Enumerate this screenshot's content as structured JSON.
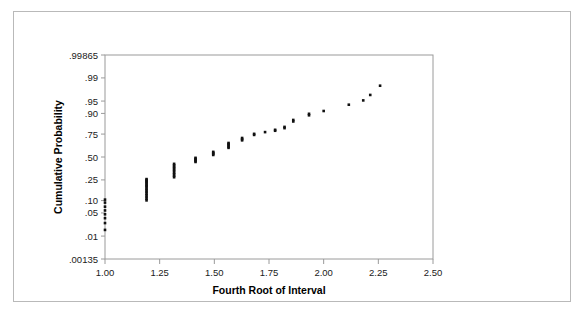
{
  "figure": {
    "background_color": "#ffffff",
    "border_color": "#b9b9b9",
    "point_color": "#111111",
    "axis_color": "#9a9a9a"
  },
  "chart_data": {
    "type": "scatter",
    "title": "",
    "subtitle": "",
    "xlabel": "Fourth Root of Interval",
    "ylabel": "Cumulative Probability",
    "yscale": "normal-probability (probit)",
    "xlim": [
      1.0,
      2.5
    ],
    "ylim": [
      0.00135,
      0.99865
    ],
    "grid": false,
    "legend": null,
    "xticks": [
      "1.00",
      "1.25",
      "1.50",
      "1.75",
      "2.00",
      "2.25",
      "2.50"
    ],
    "xtick_values": [
      1.0,
      1.25,
      1.5,
      1.75,
      2.0,
      2.25,
      2.5
    ],
    "yticks": [
      ".99865",
      ".99",
      ".95",
      ".90",
      ".75",
      ".50",
      ".25",
      ".10",
      ".05",
      ".01",
      ".00135"
    ],
    "ytick_values": [
      0.99865,
      0.99,
      0.95,
      0.9,
      0.75,
      0.5,
      0.25,
      0.1,
      0.05,
      0.01,
      0.00135
    ],
    "ytick_z": [
      3.0,
      2.326,
      1.645,
      1.282,
      0.674,
      0.0,
      -0.674,
      -1.282,
      -1.645,
      -2.326,
      -3.0
    ],
    "points": [
      {
        "x": 1.0,
        "y": 0.105
      },
      {
        "x": 1.0,
        "y": 0.09
      },
      {
        "x": 1.0,
        "y": 0.072
      },
      {
        "x": 1.0,
        "y": 0.058
      },
      {
        "x": 1.0,
        "y": 0.046
      },
      {
        "x": 1.0,
        "y": 0.036
      },
      {
        "x": 1.0,
        "y": 0.026
      },
      {
        "x": 1.0,
        "y": 0.016
      },
      {
        "x": 1.19,
        "y": 0.258
      },
      {
        "x": 1.19,
        "y": 0.248
      },
      {
        "x": 1.19,
        "y": 0.238
      },
      {
        "x": 1.19,
        "y": 0.228
      },
      {
        "x": 1.19,
        "y": 0.218
      },
      {
        "x": 1.19,
        "y": 0.206
      },
      {
        "x": 1.19,
        "y": 0.196
      },
      {
        "x": 1.19,
        "y": 0.186
      },
      {
        "x": 1.19,
        "y": 0.174
      },
      {
        "x": 1.19,
        "y": 0.163
      },
      {
        "x": 1.19,
        "y": 0.152
      },
      {
        "x": 1.19,
        "y": 0.141
      },
      {
        "x": 1.19,
        "y": 0.13
      },
      {
        "x": 1.19,
        "y": 0.12
      },
      {
        "x": 1.19,
        "y": 0.11
      },
      {
        "x": 1.19,
        "y": 0.101
      },
      {
        "x": 1.316,
        "y": 0.42
      },
      {
        "x": 1.316,
        "y": 0.404
      },
      {
        "x": 1.316,
        "y": 0.388
      },
      {
        "x": 1.316,
        "y": 0.372
      },
      {
        "x": 1.316,
        "y": 0.356
      },
      {
        "x": 1.316,
        "y": 0.34
      },
      {
        "x": 1.316,
        "y": 0.322
      },
      {
        "x": 1.316,
        "y": 0.306
      },
      {
        "x": 1.316,
        "y": 0.29
      },
      {
        "x": 1.316,
        "y": 0.276
      },
      {
        "x": 1.414,
        "y": 0.49
      },
      {
        "x": 1.414,
        "y": 0.478
      },
      {
        "x": 1.414,
        "y": 0.466
      },
      {
        "x": 1.414,
        "y": 0.454
      },
      {
        "x": 1.414,
        "y": 0.442
      },
      {
        "x": 1.495,
        "y": 0.56
      },
      {
        "x": 1.495,
        "y": 0.548
      },
      {
        "x": 1.495,
        "y": 0.536
      },
      {
        "x": 1.495,
        "y": 0.524
      },
      {
        "x": 1.565,
        "y": 0.66
      },
      {
        "x": 1.565,
        "y": 0.648
      },
      {
        "x": 1.565,
        "y": 0.634
      },
      {
        "x": 1.565,
        "y": 0.62
      },
      {
        "x": 1.565,
        "y": 0.606
      },
      {
        "x": 1.627,
        "y": 0.712
      },
      {
        "x": 1.627,
        "y": 0.7
      },
      {
        "x": 1.627,
        "y": 0.688
      },
      {
        "x": 1.682,
        "y": 0.752
      },
      {
        "x": 1.682,
        "y": 0.742
      },
      {
        "x": 1.732,
        "y": 0.768
      },
      {
        "x": 1.778,
        "y": 0.788
      },
      {
        "x": 1.778,
        "y": 0.78
      },
      {
        "x": 1.821,
        "y": 0.812
      },
      {
        "x": 1.821,
        "y": 0.802
      },
      {
        "x": 1.861,
        "y": 0.862
      },
      {
        "x": 1.861,
        "y": 0.852
      },
      {
        "x": 1.933,
        "y": 0.898
      },
      {
        "x": 1.933,
        "y": 0.89
      },
      {
        "x": 2.0,
        "y": 0.912
      },
      {
        "x": 2.115,
        "y": 0.938
      },
      {
        "x": 2.181,
        "y": 0.952
      },
      {
        "x": 2.213,
        "y": 0.966
      },
      {
        "x": 2.258,
        "y": 0.982
      }
    ]
  }
}
